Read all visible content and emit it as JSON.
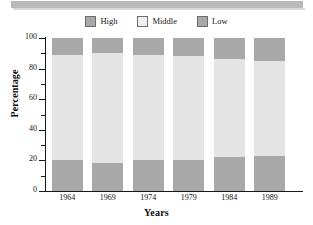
{
  "chart_data": {
    "type": "bar",
    "subtype": "stacked-100",
    "title": "",
    "xlabel": "Years",
    "ylabel": "Percentage",
    "categories": [
      "1964",
      "1969",
      "1974",
      "1979",
      "1984",
      "1989"
    ],
    "ylim": [
      0,
      100
    ],
    "yticks": [
      0,
      20,
      40,
      60,
      80,
      100
    ],
    "ytick_labels": [
      "0",
      "20",
      "40",
      "60",
      "80",
      "100"
    ],
    "yminor_ticks": [
      10,
      30,
      50,
      70,
      90
    ],
    "grid": false,
    "legend_position": "top-center",
    "series": [
      {
        "name": "Low",
        "color": "#a8a8a8",
        "values": [
          20,
          18,
          20,
          20,
          22,
          23
        ],
        "stack_order": 0
      },
      {
        "name": "Middle",
        "color": "#e4e4e4",
        "values": [
          69,
          72,
          69,
          68,
          64,
          62
        ],
        "stack_order": 1
      },
      {
        "name": "High",
        "color": "#a8a8a8",
        "values": [
          11,
          10,
          11,
          12,
          14,
          15
        ],
        "stack_order": 2
      }
    ],
    "legend": [
      {
        "label": "High",
        "color": "#a8a8a8"
      },
      {
        "label": "Middle",
        "color": "#efefef"
      },
      {
        "label": "Low",
        "color": "#a8a8a8"
      }
    ]
  },
  "colors": {
    "dark_gray": "#a8a8a8",
    "light_gray": "#e4e4e4",
    "legend_middle": "#efefef",
    "swatch_border": "#6d6d6d",
    "axis": "#1a1a1a",
    "header_strip": "#b9b9b9",
    "text": "#121212",
    "background": "#ffffff"
  }
}
